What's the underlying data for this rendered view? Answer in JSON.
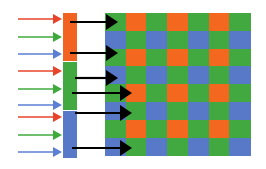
{
  "diagram": {
    "background": "#ffffff",
    "width": 266,
    "height": 169
  },
  "palette": {
    "red": "#e8442a",
    "green": "#3faa3c",
    "blue": "#5b7fd4",
    "orange": "#f26322",
    "grid_green": "#41a93f",
    "grid_blue": "#5878c8",
    "grid_orange": "#f4671f",
    "black": "#000000",
    "white": "#ffffff"
  },
  "incoming_light_arrows": {
    "name": "incoming-light-arrows",
    "count": 9,
    "x_start": 18,
    "x_end": 62,
    "head_length": 9,
    "head_half_height": 5,
    "stroke_width": 1.6,
    "items": [
      {
        "label": "red-light-ray-1",
        "color_key": "red",
        "y": 19
      },
      {
        "label": "green-light-ray-1",
        "color_key": "green",
        "y": 37
      },
      {
        "label": "blue-light-ray-1",
        "color_key": "blue",
        "y": 54
      },
      {
        "label": "red-light-ray-2",
        "color_key": "red",
        "y": 71
      },
      {
        "label": "green-light-ray-2",
        "color_key": "green",
        "y": 89
      },
      {
        "label": "blue-light-ray-2",
        "color_key": "blue",
        "y": 105
      },
      {
        "label": "red-light-ray-3",
        "color_key": "red",
        "y": 117
      },
      {
        "label": "green-light-ray-3",
        "color_key": "green",
        "y": 135
      },
      {
        "label": "blue-light-ray-3",
        "color_key": "blue",
        "y": 152
      }
    ]
  },
  "filter_bar": {
    "name": "color-filter-bar",
    "x": 63,
    "width": 14,
    "segments": [
      {
        "label": "filter-segment-orange",
        "color_key": "orange",
        "y": 13,
        "height": 48
      },
      {
        "label": "filter-segment-green",
        "color_key": "grid_green",
        "y": 62,
        "height": 48
      },
      {
        "label": "filter-segment-blue",
        "color_key": "grid_blue",
        "y": 111,
        "height": 47
      }
    ]
  },
  "filtered_arrows": {
    "name": "filtered-light-arrows",
    "count": 6,
    "color_key": "black",
    "stroke_width": 2.2,
    "head_length": 12,
    "head_half_height": 8,
    "items": [
      {
        "label": "black-arrow-1",
        "y": 22,
        "x_start": 70,
        "x_end": 118
      },
      {
        "label": "black-arrow-2",
        "y": 53,
        "x_start": 70,
        "x_end": 118
      },
      {
        "label": "black-arrow-3",
        "y": 78,
        "x_start": 75,
        "x_end": 118
      },
      {
        "label": "black-arrow-4",
        "y": 93,
        "x_start": 72,
        "x_end": 132
      },
      {
        "label": "black-arrow-5",
        "y": 113,
        "x_start": 75,
        "x_end": 132
      },
      {
        "label": "black-arrow-6",
        "y": 148,
        "x_start": 72,
        "x_end": 132
      }
    ]
  },
  "bayer_grid": {
    "name": "bayer-filter-grid",
    "x": 105,
    "y": 13,
    "cell_width": 20.7,
    "cell_height": 17.8,
    "columns": 7,
    "rows": 8,
    "pattern_note": "GRGRGRG / BGBGBGB alternating Bayer RGGB mosaic",
    "matrix": [
      [
        "grid_green",
        "grid_orange",
        "grid_green",
        "grid_orange",
        "grid_green",
        "grid_orange",
        "grid_green"
      ],
      [
        "grid_blue",
        "grid_green",
        "grid_blue",
        "grid_green",
        "grid_blue",
        "grid_green",
        "grid_blue"
      ],
      [
        "grid_green",
        "grid_orange",
        "grid_green",
        "grid_orange",
        "grid_green",
        "grid_orange",
        "grid_green"
      ],
      [
        "grid_blue",
        "grid_green",
        "grid_blue",
        "grid_green",
        "grid_blue",
        "grid_green",
        "grid_blue"
      ],
      [
        "grid_green",
        "grid_orange",
        "grid_green",
        "grid_orange",
        "grid_green",
        "grid_orange",
        "grid_green"
      ],
      [
        "grid_blue",
        "grid_green",
        "grid_blue",
        "grid_green",
        "grid_blue",
        "grid_green",
        "grid_blue"
      ],
      [
        "grid_green",
        "grid_orange",
        "grid_green",
        "grid_orange",
        "grid_green",
        "grid_orange",
        "grid_green"
      ],
      [
        "grid_blue",
        "grid_green",
        "grid_blue",
        "grid_green",
        "grid_blue",
        "grid_green",
        "grid_blue"
      ]
    ]
  }
}
